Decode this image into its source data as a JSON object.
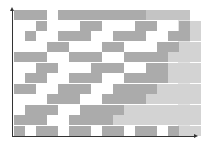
{
  "diagram": {
    "type": "staircase-block-pattern",
    "axes": {
      "x_arrow": true,
      "y_arrow": true,
      "axis_color": "#333333"
    },
    "colors": {
      "dark_block": "#ababab",
      "light_block": "#d3d3d3",
      "mid_block": "#c4c4c4",
      "background": "#ffffff",
      "right_band": "#e2e2e2"
    },
    "cell": {
      "w": 11,
      "h": 10.5
    },
    "grid": [
      "DDD.DDDDDDDDMMMM",
      "..D...DD...DD..DL",
      ".D..DDD..DDD..DDL",
      "...DD...DD...DDLL",
      "DDD..DDD..DDDDLLL",
      "..DD...DDD..DDLLL",
      ".DD..DDD..DDDDLLL",
      "DD..DDD..DDDDLLLL",
      "...DDD..DDDDLLLLL",
      ".DDD..DDDDLLLLLLL",
      "DDD..DDDDLLLLLLLL",
      "D.DD.DD.DD.DD.DLL"
    ]
  }
}
